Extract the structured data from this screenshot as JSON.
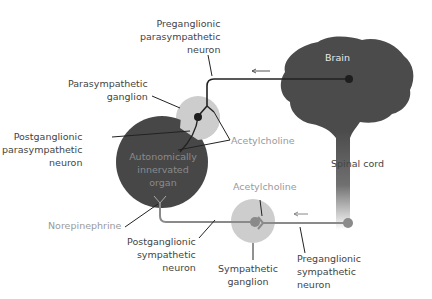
{
  "diagram": {
    "colors": {
      "brain": "#4a4a4a",
      "organ": "#474747",
      "parasympathetic_ganglion": "#cfcfcf",
      "sympathetic_ganglion": "#cfcfcf",
      "parasympathetic_line": "#222222",
      "sympathetic_line": "#8a8a8a",
      "neuron_dot_dark": "#222222",
      "neuron_dot_gray": "#8a8a8a"
    },
    "labels": {
      "preganglionic_parasympathetic": [
        "Preganglionic",
        "parasympathetic",
        "neuron"
      ],
      "parasympathetic_ganglion": [
        "Parasympathetic",
        "ganglion"
      ],
      "postganglionic_parasympathetic": [
        "Postganglionic",
        "parasympathetic",
        "neuron"
      ],
      "acetylcholine_top": "Acetylcholine",
      "brain": "Brain",
      "spinal_cord": "Spinal cord",
      "organ": [
        "Autonomically",
        "innervated",
        "organ"
      ],
      "norepinephrine": "Norepinephrine",
      "acetylcholine_bottom": "Acetylcholine",
      "postganglionic_sympathetic": [
        "Postganglionic",
        "sympathetic",
        "neuron"
      ],
      "sympathetic_ganglion": [
        "Sympathetic",
        "ganglion"
      ],
      "preganglionic_sympathetic": [
        "Preganglionic",
        "sympathetic",
        "neuron"
      ]
    }
  }
}
